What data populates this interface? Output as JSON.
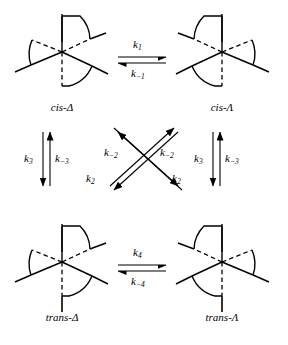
{
  "diagram": {
    "background_color": "#ffffff",
    "line_color": "#000000"
  },
  "species": [
    {
      "id": "cis-delta",
      "prefix": "cis-",
      "symbol": "Δ",
      "label": "cis-Δ",
      "position": "top-left"
    },
    {
      "id": "cis-lambda",
      "prefix": "cis-",
      "symbol": "Λ",
      "label": "cis-Λ",
      "position": "top-right"
    },
    {
      "id": "trans-delta",
      "prefix": "trans-",
      "symbol": "Δ",
      "label": "trans-Δ",
      "position": "bottom-left"
    },
    {
      "id": "trans-lambda",
      "prefix": "trans-",
      "symbol": "Λ",
      "label": "trans-Λ",
      "position": "bottom-right"
    }
  ],
  "rate_constants": {
    "top_forward": {
      "base": "k",
      "sub": "1",
      "label": "k1"
    },
    "top_reverse": {
      "base": "k",
      "sub": "−1",
      "label": "k−1"
    },
    "bottom_forward": {
      "base": "k",
      "sub": "4",
      "label": "k4"
    },
    "bottom_reverse": {
      "base": "k",
      "sub": "−4",
      "label": "k−4"
    },
    "left_down": {
      "base": "k",
      "sub": "3",
      "label": "k3"
    },
    "left_up": {
      "base": "k",
      "sub": "−3",
      "label": "k−3"
    },
    "right_down": {
      "base": "k",
      "sub": "3",
      "label": "k3"
    },
    "right_up": {
      "base": "k",
      "sub": "−3",
      "label": "k−3"
    },
    "cross_upper_left": {
      "base": "k",
      "sub": "−2",
      "label": "k−2"
    },
    "cross_upper_right": {
      "base": "k",
      "sub": "−2",
      "label": "k−2"
    },
    "cross_lower_left": {
      "base": "k",
      "sub": "2",
      "label": "k2"
    },
    "cross_lower_right": {
      "base": "k",
      "sub": "2",
      "label": "k2"
    }
  }
}
